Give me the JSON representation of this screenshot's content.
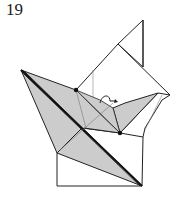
{
  "diagram": {
    "step_number": "19",
    "colors": {
      "paper_back": "#cccccc",
      "paper_front": "#ffffff",
      "line": "#222222",
      "fold_line": "#777777"
    },
    "markers": [
      "reference-point-upper",
      "reference-point-lower"
    ],
    "arrows": [
      "loop-fold-arrow"
    ]
  }
}
